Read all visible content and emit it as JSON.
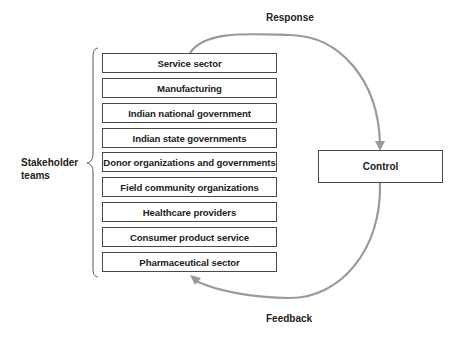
{
  "diagram": {
    "group_label_line1": "Stakeholder",
    "group_label_line2": "teams",
    "stakeholders": [
      "Service sector",
      "Manufacturing",
      "Indian national government",
      "Indian state governments",
      "Donor organizations and governments",
      "Field community organizations",
      "Healthcare providers",
      "Consumer product service",
      "Pharmaceutical sector"
    ],
    "control_label": "Control",
    "response_label": "Response",
    "feedback_label": "Feedback",
    "colors": {
      "box_border": "#4a4a4a",
      "arrow": "#9a9a9a",
      "text": "#222222"
    }
  }
}
